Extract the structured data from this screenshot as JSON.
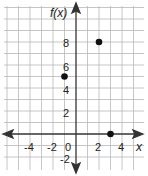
{
  "chart_data": {
    "type": "scatter",
    "title": "",
    "xlabel": "x",
    "ylabel": "f(x)",
    "xlim": [
      -6,
      6
    ],
    "ylim": [
      -3,
      11
    ],
    "grid": true,
    "x_tick_labels": [
      "-4",
      "-2",
      "0",
      "2",
      "4"
    ],
    "y_tick_labels": [
      "8",
      "6",
      "4",
      "2",
      "-2"
    ],
    "series": [
      {
        "name": "f(x)",
        "points": [
          {
            "x": -1,
            "y": 5
          },
          {
            "x": 2,
            "y": 8
          },
          {
            "x": 3,
            "y": 0
          }
        ]
      }
    ]
  },
  "labels": {
    "y_axis": "f(x)",
    "x_axis": "x",
    "tick_x_neg4": "-4",
    "tick_x_neg2": "-2",
    "tick_origin": "0",
    "tick_x_2": "2",
    "tick_x_4": "4",
    "tick_y_8": "8",
    "tick_y_6": "6",
    "tick_y_4": "4",
    "tick_y_2": "2",
    "tick_y_neg2": "-2"
  }
}
